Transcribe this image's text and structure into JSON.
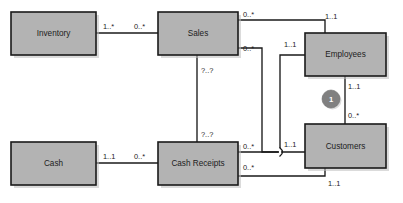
{
  "diagram": {
    "type": "uml-class-diagram",
    "background_color": "#ffffff",
    "entity_fill_color": "#b3b3b3",
    "entity_border_color": "#1a1a1a",
    "line_color": "#1a1a1a",
    "constraint_color": "#808080"
  },
  "entities": [
    {
      "id": "inventory",
      "label": "Inventory",
      "x": 11,
      "y": 12,
      "w": 85,
      "h": 43
    },
    {
      "id": "sales",
      "label": "Sales",
      "x": 158,
      "y": 12,
      "w": 80,
      "h": 43
    },
    {
      "id": "employees",
      "label": "Employees",
      "x": 305,
      "y": 33,
      "w": 81,
      "h": 43
    },
    {
      "id": "cash",
      "label": "Cash",
      "x": 11,
      "y": 142,
      "w": 85,
      "h": 43
    },
    {
      "id": "cash_receipts",
      "label": "Cash Receipts",
      "x": 158,
      "y": 142,
      "w": 80,
      "h": 43
    },
    {
      "id": "customers",
      "label": "Customers",
      "x": 305,
      "y": 124,
      "w": 81,
      "h": 44
    }
  ],
  "associations": [
    {
      "id": "inventory-sales",
      "from": "inventory",
      "to": "sales",
      "path": "M 96 33 L 158 33",
      "source_multiplicity": "1..*",
      "target_multiplicity": "0..*"
    },
    {
      "id": "sales-employees",
      "from": "sales",
      "to": "employees",
      "path": "M 238 20 L 325 20 L 325 33",
      "source_multiplicity": "0..*",
      "target_multiplicity": "1..1"
    },
    {
      "id": "sales-customers",
      "from": "sales",
      "to": "customers",
      "path": "M 238 48 L 262 48 L 262 152 L 305 152",
      "source_multiplicity": "0..*",
      "target_multiplicity": "1..1"
    },
    {
      "id": "sales-cash-receipts",
      "from": "sales",
      "to": "cash_receipts",
      "path": "M 197 55 L 197 142",
      "source_multiplicity": "?..?",
      "target_multiplicity": "?..?"
    },
    {
      "id": "cash-cash-receipts",
      "from": "cash",
      "to": "cash_receipts",
      "path": "M 96 163 L 158 163",
      "source_multiplicity": "1..1",
      "target_multiplicity": "0..*"
    },
    {
      "id": "cash-receipts-employees",
      "from": "cash_receipts",
      "to": "employees",
      "path": "M 238 152 L 280 152 L 280 55 L 305 55",
      "source_multiplicity": "0..*",
      "target_multiplicity": "1..1"
    },
    {
      "id": "cash-receipts-customers",
      "from": "cash_receipts",
      "to": "customers",
      "path": "M 238 176 L 325 176 L 325 168",
      "source_multiplicity": "0..*",
      "target_multiplicity": "1..1"
    },
    {
      "id": "employees-customers",
      "from": "employees",
      "to": "customers",
      "path": "M 345 76 L 345 124",
      "source_multiplicity": "1..1",
      "target_multiplicity": "0..*"
    }
  ],
  "multiplicity_labels": [
    {
      "id": "m-inventory-right",
      "text": "1..*",
      "x": 103,
      "y": 29
    },
    {
      "id": "m-sales-left",
      "text": "0..*",
      "x": 134,
      "y": 29
    },
    {
      "id": "m-sales-topright",
      "text": "0..*",
      "x": 243,
      "y": 17
    },
    {
      "id": "m-employees-topleft",
      "text": "1..1",
      "x": 325,
      "y": 19
    },
    {
      "id": "m-sales-midright",
      "text": "0..*",
      "x": 243,
      "y": 51
    },
    {
      "id": "m-employees-left",
      "text": "1..1",
      "x": 284,
      "y": 47
    },
    {
      "id": "m-sales-bottom",
      "text": "?..?",
      "x": 201,
      "y": 73
    },
    {
      "id": "m-employees-bottom",
      "text": "1..1",
      "x": 348,
      "y": 89
    },
    {
      "id": "m-customers-top",
      "text": "0..*",
      "x": 348,
      "y": 118
    },
    {
      "id": "m-cash-receipts-top",
      "text": "?..?",
      "x": 201,
      "y": 137
    },
    {
      "id": "m-cash-receipts-right-1",
      "text": "0..*",
      "x": 243,
      "y": 149
    },
    {
      "id": "m-customers-left",
      "text": "1..1",
      "x": 284,
      "y": 147
    },
    {
      "id": "m-cash-right",
      "text": "1..1",
      "x": 103,
      "y": 159
    },
    {
      "id": "m-cash-receipts-left",
      "text": "0..*",
      "x": 134,
      "y": 159
    },
    {
      "id": "m-cash-receipts-right-2",
      "text": "0..*",
      "x": 243,
      "y": 170
    },
    {
      "id": "m-customers-bottom",
      "text": "1..1",
      "x": 328,
      "y": 186
    }
  ],
  "constraints": [
    {
      "id": "xor-constraint-1",
      "label": "1",
      "cx": 331,
      "cy": 99,
      "r": 9
    }
  ]
}
